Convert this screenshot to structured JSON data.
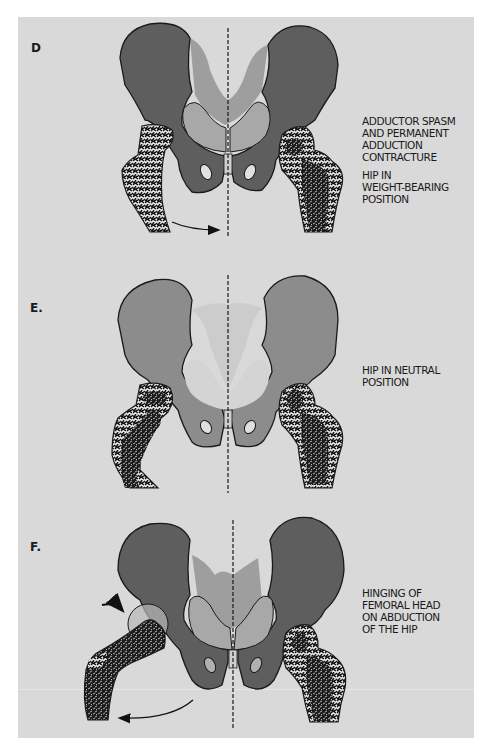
{
  "figure": {
    "background_color": "#d9d9d9",
    "bone_dark_color": "#5e5e5e",
    "bone_light_color": "#8f8f8f",
    "outline_color": "#1a1a1a",
    "panels": [
      {
        "label": "D",
        "caption_lines": [
          "ADDUCTOR SPASM",
          "AND PERMANENT",
          "ADDUCTION",
          "CONTRACTURE"
        ],
        "caption2_lines": [
          "HIP IN",
          "WEIGHT-BEARING",
          "POSITION"
        ]
      },
      {
        "label": "E.",
        "caption_lines": [
          "HIP IN NEUTRAL",
          "POSITION"
        ]
      },
      {
        "label": "F.",
        "caption_lines": [
          "HINGING OF",
          "FEMORAL HEAD",
          "ON ABDUCTION",
          "OF THE HIP"
        ]
      }
    ]
  }
}
